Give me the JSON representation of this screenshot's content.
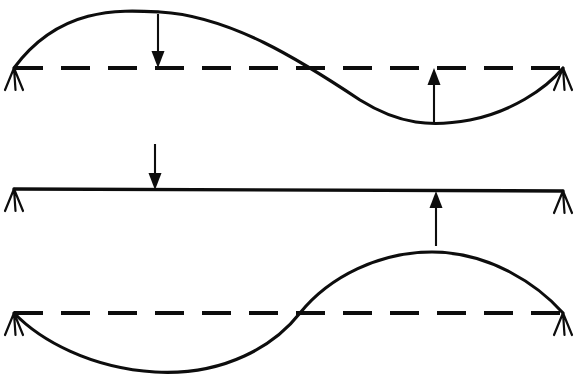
{
  "figure": {
    "canvas": {
      "width": 576,
      "height": 377
    },
    "colors": {
      "ink": "#0d0d0d",
      "background": "#ffffff"
    }
  },
  "geometry": {
    "span": {
      "left_x": 14,
      "right_x": 563
    },
    "dash_pattern": {
      "dash": 29,
      "gap": 18,
      "width": 4.2
    }
  },
  "panels": [
    {
      "id": "panel-top",
      "name": "first-mode-panel",
      "baseline_y": 68,
      "curve_type": "half-sine-up",
      "curve_path": "M14,68 C60,6 120,10 160,12 C230,16 300,60 360,100 C400,125 432,127 470,120 C510,112 545,90 563,68",
      "reference_line": {
        "x1": 14,
        "y1": 68,
        "x2": 563,
        "y2": 68
      },
      "supports": [
        {
          "name": "support-top-left",
          "x": 14,
          "y": 68,
          "type": "pin"
        },
        {
          "name": "support-top-right",
          "x": 563,
          "y": 68,
          "type": "pin"
        }
      ],
      "loads": [
        {
          "name": "load-down-top",
          "direction": "down",
          "x": 158,
          "tail_y": 14,
          "tip_y": 68
        },
        {
          "name": "load-up-top",
          "direction": "up",
          "x": 434,
          "tail_y": 124,
          "tip_y": 68
        }
      ]
    },
    {
      "id": "panel-middle",
      "name": "undeformed-beam-panel",
      "baseline_y": 190,
      "curve_type": "straight",
      "curve_path": "M14,189 L563,191",
      "reference_line": null,
      "supports": [
        {
          "name": "support-middle-left",
          "x": 14,
          "y": 189,
          "type": "pin"
        },
        {
          "name": "support-middle-right",
          "x": 563,
          "y": 191,
          "type": "pin"
        }
      ],
      "loads": [
        {
          "name": "load-down-middle",
          "direction": "down",
          "x": 155,
          "tail_y": 144,
          "tip_y": 190
        },
        {
          "name": "load-up-middle",
          "direction": "up",
          "x": 436,
          "tail_y": 246,
          "tip_y": 191
        }
      ]
    },
    {
      "id": "panel-bottom",
      "name": "second-mode-panel",
      "baseline_y": 313,
      "curve_type": "full-sine",
      "curve_path": "M14,313 C40,340 90,368 155,372 C225,376 275,345 300,313 C330,276 380,252 432,252 C490,252 538,285 563,313",
      "reference_line": {
        "x1": 14,
        "y1": 313,
        "x2": 563,
        "y2": 313
      },
      "supports": [
        {
          "name": "support-bottom-left",
          "x": 14,
          "y": 313,
          "type": "pin"
        },
        {
          "name": "support-bottom-right",
          "x": 563,
          "y": 313,
          "type": "pin"
        }
      ],
      "loads": []
    }
  ],
  "support_shape": {
    "apex_offset_y": 0,
    "leg_height": 22,
    "leg_spread": 9
  },
  "arrow_head": {
    "half_width": 6.5,
    "length": 17
  }
}
